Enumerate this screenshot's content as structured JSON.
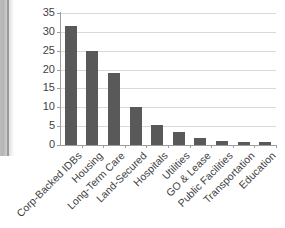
{
  "chart_data": {
    "type": "bar",
    "title": "",
    "subtitle": "",
    "xlabel": "",
    "ylabel": "",
    "categories": [
      "Corp-Backed IDBs",
      "Housing",
      "Long-Term Care",
      "Land-Secured",
      "Hospitals",
      "Utilities",
      "GO & Lease",
      "Public Facilities",
      "Transportation",
      "Education"
    ],
    "values": [
      31.6,
      24.9,
      19.1,
      10.1,
      5.2,
      3.4,
      1.8,
      1.0,
      0.9,
      0.7
    ],
    "ylim": [
      0,
      35
    ],
    "yticks": [
      0,
      5,
      10,
      15,
      20,
      25,
      30,
      35
    ],
    "ytick_labels": [
      "0",
      "5",
      "10",
      "15",
      "20",
      "25",
      "30",
      "35"
    ],
    "grid": true,
    "legend": false,
    "legend_position": "none",
    "series": [
      {
        "name": "",
        "values": [
          31.6,
          24.9,
          19.1,
          10.1,
          5.2,
          3.4,
          1.8,
          1.0,
          0.9,
          0.7
        ]
      }
    ],
    "colors": {
      "bar": "#595959",
      "gridline": "#d9d9d9",
      "axis": "#9c9c9c",
      "text": "#3f3f3f",
      "background": "#ffffff"
    }
  }
}
